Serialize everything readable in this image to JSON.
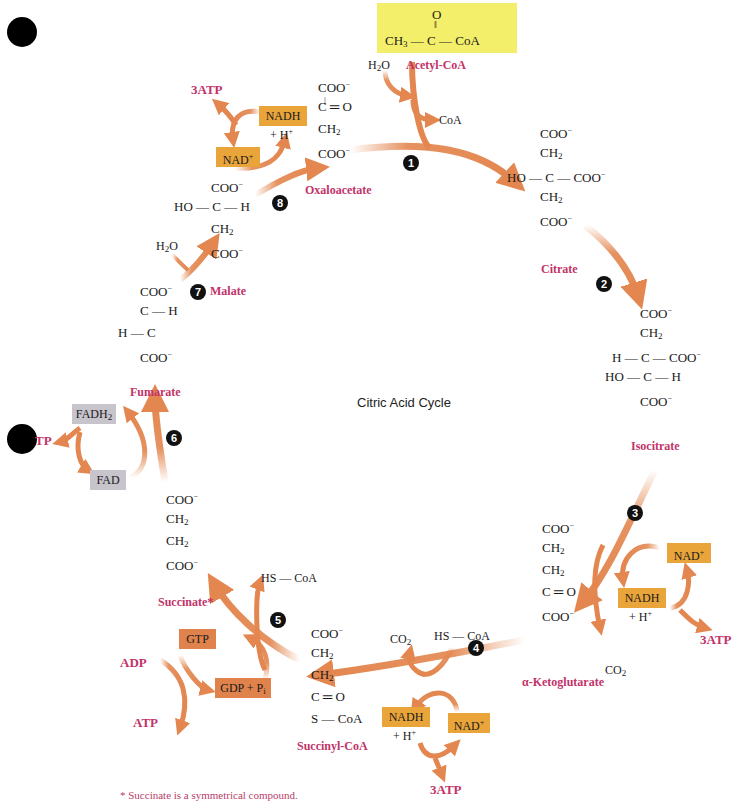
{
  "title": "Citric Acid Cycle",
  "footnote": "* Succinate is a symmetrical compound.",
  "colors": {
    "arrow": "#e3864f",
    "nad_box": "#e9a53a",
    "gtp_box": "#e0824c",
    "fad_box": "#c7c4cc",
    "acetyl_highlight": "#f4ef6a",
    "label_pink": "#c2336a"
  },
  "molecules": {
    "acetyl_coa": {
      "name": "Acetyl-CoA",
      "top": "O",
      "formula": "CH3—C—CoA"
    },
    "citrate": {
      "name": "Citrate",
      "lines": [
        "COO⁻",
        "CH₂",
        "HO — C — COO⁻",
        "CH₂",
        "COO⁻"
      ]
    },
    "isocitrate": {
      "name": "Isocitrate",
      "lines": [
        "COO⁻",
        "CH₂",
        "H — C — COO⁻",
        "HO — C — H",
        "COO⁻"
      ]
    },
    "alpha_ketoglutarate": {
      "name": "α-Ketoglutarate",
      "lines": [
        "COO⁻",
        "CH₂",
        "CH₂",
        "C ═ O",
        "COO⁻"
      ]
    },
    "succinyl_coa": {
      "name": "Succinyl-CoA",
      "lines": [
        "COO⁻",
        "CH₂",
        "CH₂",
        "C ═ O",
        "S — CoA"
      ]
    },
    "succinate": {
      "name": "Succinate*",
      "lines": [
        "COO⁻",
        "CH₂",
        "CH₂",
        "COO⁻"
      ]
    },
    "fumarate": {
      "name": "Fumarate",
      "lines": [
        "COO⁻",
        "C — H",
        "H — C",
        "COO⁻"
      ]
    },
    "malate": {
      "name": "Malate",
      "lines": [
        "COO⁻",
        "HO — C — H",
        "CH₂",
        "COO⁻"
      ]
    },
    "oxaloacetate": {
      "name": "Oxaloacetate",
      "lines": [
        "COO⁻",
        "C ═ O",
        "CH₂",
        "COO⁻"
      ]
    }
  },
  "cofactors": {
    "step1_in": "H2O",
    "step1_out": "CoA",
    "step3_nad": "NAD+",
    "step3_nadh": "NADH",
    "step3_h": "+ H+",
    "step3_atp": "3ATP",
    "step3_co2": "CO2",
    "step4_co2": "CO2",
    "step4_hscoa": "HS — CoA",
    "step4_nadh": "NADH",
    "step4_h": "+ H+",
    "step4_nad": "NAD+",
    "step4_atp": "3ATP",
    "step5_hscoa": "HS — CoA",
    "step5_gtp": "GTP",
    "step5_gdp": "GDP + Pi",
    "step5_adp": "ADP",
    "step5_atp": "ATP",
    "step6_fadh2": "FADH2",
    "step6_fad": "FAD",
    "step6_atp": "TP",
    "step7_in": "H2O",
    "step8_nad": "NAD+",
    "step8_nadh": "NADH",
    "step8_h": "+ H+",
    "step8_atp": "3ATP"
  },
  "steps": [
    "1",
    "2",
    "3",
    "4",
    "5",
    "6",
    "7",
    "8"
  ]
}
